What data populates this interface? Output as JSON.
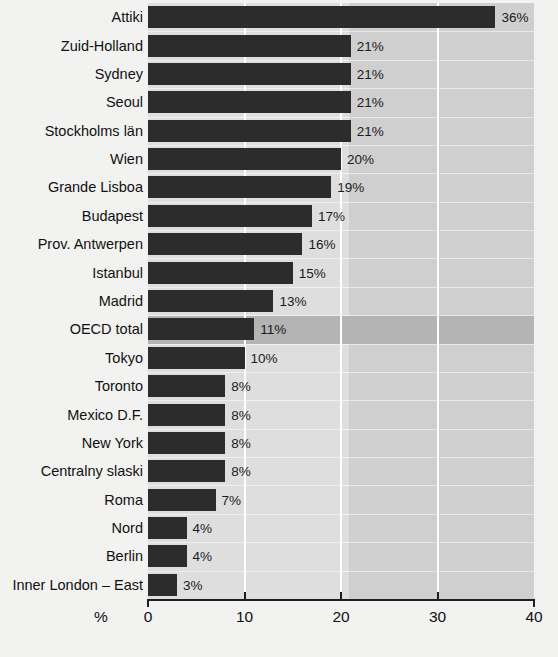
{
  "chart_data": {
    "type": "bar",
    "orientation": "horizontal",
    "title": "",
    "subtitle": "",
    "xlabel": "%",
    "ylabel": "",
    "xlim": [
      0,
      40
    ],
    "xticks": [
      0,
      10,
      20,
      30,
      40
    ],
    "xticklabels": [
      "0",
      "10",
      "20",
      "30",
      "40"
    ],
    "grid": "vertical-white-gridlines",
    "legend": "none",
    "value_label_suffix": "%",
    "highlight_category": "OECD total",
    "categories": [
      "Attiki",
      "Zuid-Holland",
      "Sydney",
      "Seoul",
      "Stockholms län",
      "Wien",
      "Grande Lisboa",
      "Budapest",
      "Prov. Antwerpen",
      "Istanbul",
      "Madrid",
      "OECD total",
      "Tokyo",
      "Toronto",
      "Mexico D.F.",
      "New York",
      "Centralny slaski",
      "Roma",
      "Nord",
      "Berlin",
      "Inner London – East"
    ],
    "values": [
      36,
      21,
      21,
      21,
      21,
      20,
      19,
      17,
      16,
      15,
      13,
      11,
      10,
      8,
      8,
      8,
      8,
      7,
      4,
      4,
      3
    ],
    "value_labels": [
      "36%",
      "21%",
      "21%",
      "21%",
      "21%",
      "20%",
      "19%",
      "17%",
      "16%",
      "15%",
      "13%",
      "11%",
      "10%",
      "8%",
      "8%",
      "8%",
      "8%",
      "7%",
      "4%",
      "4%",
      "3%"
    ]
  },
  "colors": {
    "bar": "#2c2c2c",
    "plot_background": "#d2d2d2",
    "plot_background_light": "#dedede",
    "highlight_row": "#b4b4b4",
    "gridline": "#ffffff",
    "axis": "#1f1f1f",
    "page_background": "#f2f2f0",
    "text": "#111111"
  }
}
